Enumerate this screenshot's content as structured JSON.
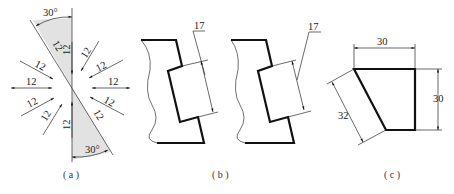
{
  "figure": {
    "panels": [
      {
        "id": "a",
        "caption": "( a )",
        "angle_label_top": "30°",
        "angle_label_bottom": "30°",
        "dimension_labels": [
          "12",
          "12",
          "12",
          "12",
          "12",
          "12",
          "12",
          "12",
          "12",
          "12",
          "12",
          "12"
        ]
      },
      {
        "id": "b",
        "caption": "( b )",
        "left_dimension": "17",
        "right_dimension": "17"
      },
      {
        "id": "c",
        "caption": "( c )",
        "top_dimension": "30",
        "right_dimension": "30",
        "slant_dimension": "32"
      }
    ]
  }
}
